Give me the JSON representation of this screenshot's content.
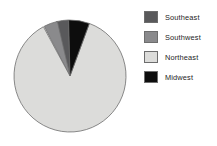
{
  "chart_data": {
    "type": "pie",
    "title": "",
    "subtitle": "",
    "xlabel": "",
    "ylabel": "",
    "grid": false,
    "legend_position": "right",
    "start_angle_deg": -27,
    "direction": "clockwise",
    "categories": [
      "Southeast",
      "Southwest",
      "Northeast",
      "Midwest"
    ],
    "values": [
      3.5,
      4.0,
      86.5,
      6.0
    ],
    "slice_colors": [
      "#59595b",
      "#8a8a8c",
      "#dcdcda",
      "#0d0d0d"
    ],
    "slice_border_color": "#6d6d6d",
    "slices": [
      {
        "label": "Southeast",
        "value": 3.5,
        "color": "#59595b",
        "start_deg": -14.0,
        "end_deg": -1.4
      },
      {
        "label": "Southwest",
        "value": 4.0,
        "color": "#8a8a8c",
        "start_deg": -27.4,
        "end_deg": -13.0
      },
      {
        "label": "Northeast",
        "value": 86.5,
        "color": "#dcdcda",
        "start_deg": 20.2,
        "end_deg": 331.6
      },
      {
        "label": "Midwest",
        "value": 6.0,
        "color": "#0d0d0d",
        "start_deg": -1.4,
        "end_deg": 20.2
      }
    ],
    "legend_entries": [
      {
        "label": "Southeast",
        "color": "#59595b"
      },
      {
        "label": "Southwest",
        "color": "#8a8a8c"
      },
      {
        "label": "Northeast",
        "color": "#dcdcda"
      },
      {
        "label": "Midwest",
        "color": "#0d0d0d"
      }
    ]
  },
  "pie_geometry": {
    "cx": 59,
    "cy": 58,
    "r": 56
  }
}
